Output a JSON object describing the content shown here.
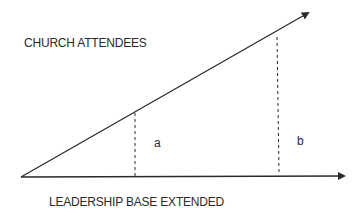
{
  "diagram": {
    "y_axis_label": "CHURCH ATTENDEES",
    "x_axis_label": "LEADERSHIP BASE EXTENDED",
    "segments": [
      {
        "label": "a"
      },
      {
        "label": "b"
      }
    ],
    "colors": {
      "line": "#2a2a2a",
      "background": "#ffffff"
    }
  }
}
